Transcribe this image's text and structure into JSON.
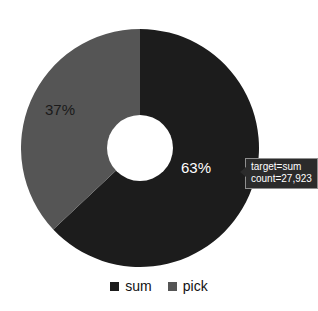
{
  "chart_data": {
    "type": "pie",
    "variant": "donut",
    "title": "",
    "title_note": "title is cropped off the top edge of the screenshot and is unreadable",
    "categories": [
      "sum",
      "pick"
    ],
    "values": [
      63,
      37
    ],
    "value_unit": "%",
    "data_labels": [
      "63%",
      "37%"
    ],
    "colors": [
      "#1c1c1c",
      "#555555"
    ],
    "legend": {
      "position": "bottom",
      "entries": [
        {
          "label": "sum",
          "color": "#1c1c1c"
        },
        {
          "label": "pick",
          "color": "#555555"
        }
      ]
    },
    "start_angle_deg": 0,
    "direction": "clockwise",
    "inner_radius_ratio": 0.28
  },
  "slices": [
    {
      "name": "sum",
      "percent_label": "63%",
      "color": "#1c1c1c",
      "label_color": "#ffffff",
      "label_x": 196,
      "label_y": 169
    },
    {
      "name": "pick",
      "percent_label": "37%",
      "color": "#555555",
      "label_color": "#1a1a1a",
      "label_x": 60,
      "label_y": 111
    }
  ],
  "tooltip": {
    "line1": "target=sum",
    "line2": "count=27,923",
    "background": "#2b2b2b",
    "text_color": "#ffffff",
    "border_color": "#8f8f8f"
  },
  "legend": {
    "items": [
      {
        "label": "sum",
        "color": "#1c1c1c"
      },
      {
        "label": "pick",
        "color": "#555555"
      }
    ]
  },
  "page": {
    "background": "#ffffff"
  }
}
